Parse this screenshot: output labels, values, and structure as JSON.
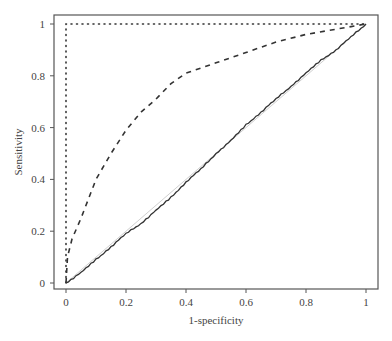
{
  "chart_data": {
    "type": "line",
    "title": "",
    "xlabel": "1-specificity",
    "ylabel": "Sensitivity",
    "xlim": [
      0,
      1
    ],
    "ylim": [
      0,
      1
    ],
    "grid": false,
    "legend": null,
    "x_ticks": [
      "0",
      "0.2",
      "0.4",
      "0.6",
      "0.8",
      "1"
    ],
    "y_ticks": [
      "0",
      "0.2",
      "0.4",
      "0.6",
      "0.8",
      "1"
    ],
    "series": [
      {
        "name": "perfect-classifier",
        "style": "dotted",
        "x": [
          0,
          0,
          1
        ],
        "y": [
          0,
          1,
          1
        ]
      },
      {
        "name": "dashed-roc",
        "style": "dashed",
        "x": [
          0,
          0.005,
          0.02,
          0.05,
          0.1,
          0.15,
          0.2,
          0.25,
          0.3,
          0.35,
          0.4,
          0.5,
          0.6,
          0.7,
          0.8,
          0.9,
          0.95,
          1
        ],
        "y": [
          0,
          0.1,
          0.17,
          0.25,
          0.4,
          0.5,
          0.59,
          0.66,
          0.71,
          0.77,
          0.81,
          0.85,
          0.89,
          0.93,
          0.96,
          0.98,
          0.99,
          1
        ]
      },
      {
        "name": "solid-roc",
        "style": "solid",
        "x": [
          0,
          0.05,
          0.1,
          0.15,
          0.2,
          0.25,
          0.3,
          0.35,
          0.4,
          0.45,
          0.5,
          0.55,
          0.6,
          0.65,
          0.7,
          0.75,
          0.8,
          0.85,
          0.9,
          0.95,
          1
        ],
        "y": [
          0,
          0.04,
          0.09,
          0.14,
          0.19,
          0.23,
          0.28,
          0.33,
          0.39,
          0.44,
          0.5,
          0.55,
          0.61,
          0.66,
          0.71,
          0.76,
          0.81,
          0.86,
          0.9,
          0.95,
          1
        ]
      },
      {
        "name": "diagonal-reference",
        "style": "light-solid",
        "x": [
          0,
          1
        ],
        "y": [
          0,
          1
        ]
      }
    ]
  }
}
